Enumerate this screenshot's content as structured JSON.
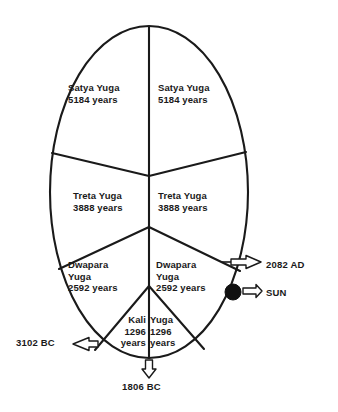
{
  "diagram": {
    "type": "yuga-cycle-oval",
    "title_partial": "",
    "background_color": "#ffffff",
    "stroke_color": "#1a1a1a",
    "marker_color": "#111111",
    "segments": [
      {
        "id": "satya-left",
        "name": "Satya Yuga",
        "duration": "5184 years",
        "text": "Satya Yuga\n5184 years",
        "side": "left"
      },
      {
        "id": "satya-right",
        "name": "Satya Yuga",
        "duration": "5184 years",
        "text": "Satya Yuga\n5184 years",
        "side": "right"
      },
      {
        "id": "treta-left",
        "name": "Treta Yuga",
        "duration": "3888 years",
        "text": "Treta Yuga\n3888 years",
        "side": "left"
      },
      {
        "id": "treta-right",
        "name": "Treta Yuga",
        "duration": "3888 years",
        "text": "Treta Yuga\n3888 years",
        "side": "right"
      },
      {
        "id": "dwapara-left",
        "name": "Dwapara Yuga",
        "duration": "2592 years",
        "text": "Dwapara\nYuga\n2592 years",
        "side": "left"
      },
      {
        "id": "dwapara-right",
        "name": "Dwapara Yuga",
        "duration": "2592 years",
        "text": "Dwapara\nYuga\n2592 years",
        "side": "right"
      },
      {
        "id": "kali-left",
        "name": "Kali Yuga",
        "duration": "1296 years",
        "text": "Kali\n1296\nyears",
        "side": "left"
      },
      {
        "id": "kali-right",
        "name": "Kali Yuga",
        "duration": "1296 years",
        "text": "Yuga\n1296\nyears",
        "side": "right"
      }
    ],
    "callouts": [
      {
        "id": "epoch-3102-bc",
        "label": "3102 BC",
        "arrow_direction": "left"
      },
      {
        "id": "epoch-1806-bc",
        "label": "1806 BC",
        "arrow_direction": "down"
      },
      {
        "id": "epoch-2082-ad",
        "label": "2082 AD",
        "arrow_direction": "right"
      },
      {
        "id": "sun-marker",
        "label": "SUN",
        "arrow_direction": "right"
      }
    ]
  }
}
